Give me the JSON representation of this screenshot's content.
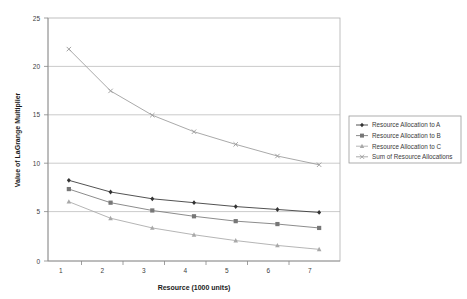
{
  "chart_data": {
    "type": "line",
    "title": "",
    "xlabel": "Resource (1000 units)",
    "ylabel": "Value of LaGrange Multiplier",
    "x": [
      1,
      2,
      3,
      4,
      5,
      6,
      7
    ],
    "xtick_labels": [
      "1",
      "2",
      "3",
      "4",
      "5",
      "6",
      "7"
    ],
    "ytick_labels": [
      "0",
      "5",
      "10",
      "15",
      "20",
      "25"
    ],
    "yticks": [
      0,
      5,
      10,
      15,
      20,
      25
    ],
    "xlim": [
      0.5,
      7.5
    ],
    "ylim": [
      0,
      25
    ],
    "grid": "horizontal",
    "legend_position": "right",
    "series": [
      {
        "name": "Resource Allocation to A",
        "marker": "diamond",
        "color": "#333333",
        "values": [
          8.3,
          7.1,
          6.4,
          6.0,
          5.6,
          5.3,
          5.0
        ]
      },
      {
        "name": "Resource Allocation to B",
        "marker": "square",
        "color": "#777777",
        "values": [
          7.4,
          6.0,
          5.2,
          4.6,
          4.1,
          3.8,
          3.4
        ]
      },
      {
        "name": "Resource Allocation to C",
        "marker": "triangle",
        "color": "#a8a8a8",
        "values": [
          6.1,
          4.4,
          3.4,
          2.7,
          2.1,
          1.6,
          1.2
        ]
      },
      {
        "name": "Sum of Resource Allocations",
        "marker": "cross",
        "color": "#9a9a9a",
        "values": [
          21.8,
          17.5,
          15.0,
          13.3,
          12.0,
          10.8,
          9.9
        ]
      }
    ]
  },
  "legend": {
    "items": [
      {
        "label": "Resource Allocation to A"
      },
      {
        "label": "Resource Allocation to B"
      },
      {
        "label": "Resource Allocation to C"
      },
      {
        "label": "Sum of Resource Allocations"
      }
    ]
  },
  "axes": {
    "y_title": "Value of LaGrange Multiplier",
    "x_title": "Resource (1000 units)",
    "y_ticks": [
      "25",
      "20",
      "15",
      "10",
      "5",
      "0"
    ],
    "x_ticks": [
      "1",
      "2",
      "3",
      "4",
      "5",
      "6",
      "7"
    ]
  }
}
